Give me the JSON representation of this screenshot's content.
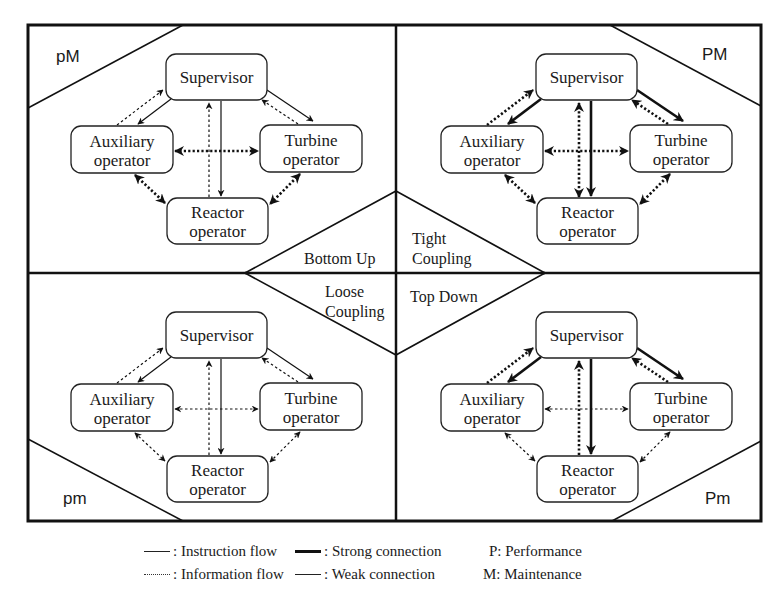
{
  "diagram": {
    "nodes": {
      "supervisor": "Supervisor",
      "auxiliary_line1": "Auxiliary",
      "auxiliary_line2": "operator",
      "turbine_line1": "Turbine",
      "turbine_line2": "operator",
      "reactor_line1": "Reactor",
      "reactor_line2": "operator"
    },
    "quadrants": [
      {
        "id": "top-left",
        "label": "pM",
        "edges": {
          "sup_aux_info": "weak",
          "sup_aux_instr": "weak",
          "sup_tur_info": "weak",
          "sup_tur_instr": "weak",
          "sup_rea_info": "weak",
          "sup_rea_instr": "weak",
          "aux_tur_info": "strong",
          "aux_rea_info": "strong",
          "tur_rea_info": "strong"
        }
      },
      {
        "id": "top-right",
        "label": "PM",
        "edges": {
          "sup_aux_info": "strong",
          "sup_aux_instr": "strong",
          "sup_tur_info": "strong",
          "sup_tur_instr": "strong",
          "sup_rea_info": "strong",
          "sup_rea_instr": "strong",
          "aux_tur_info": "strong",
          "aux_rea_info": "strong",
          "tur_rea_info": "strong"
        }
      },
      {
        "id": "bottom-left",
        "label": "pm",
        "edges": {
          "sup_aux_info": "weak",
          "sup_aux_instr": "weak",
          "sup_tur_info": "weak",
          "sup_tur_instr": "weak",
          "sup_rea_info": "weak",
          "sup_rea_instr": "weak",
          "aux_tur_info": "weak",
          "aux_rea_info": "weak",
          "tur_rea_info": "weak"
        }
      },
      {
        "id": "bottom-right",
        "label": "Pm",
        "edges": {
          "sup_aux_info": "strong",
          "sup_aux_instr": "strong",
          "sup_tur_info": "strong",
          "sup_tur_instr": "strong",
          "sup_rea_info": "strong",
          "sup_rea_instr": "strong",
          "aux_tur_info": "weak",
          "aux_rea_info": "weak",
          "tur_rea_info": "weak"
        }
      }
    ],
    "center": {
      "bottom_up": "Bottom Up",
      "tight_line1": "Tight",
      "tight_line2": "Coupling",
      "loose_line1": "Loose",
      "loose_line2": "Coupling",
      "top_down": "Top Down"
    }
  },
  "legend": {
    "instruction_flow": ": Instruction flow",
    "information_flow": ": Information flow",
    "strong_connection": ": Strong connection",
    "weak_connection": ": Weak connection",
    "performance": "P: Performance",
    "maintenance": "M: Maintenance"
  }
}
